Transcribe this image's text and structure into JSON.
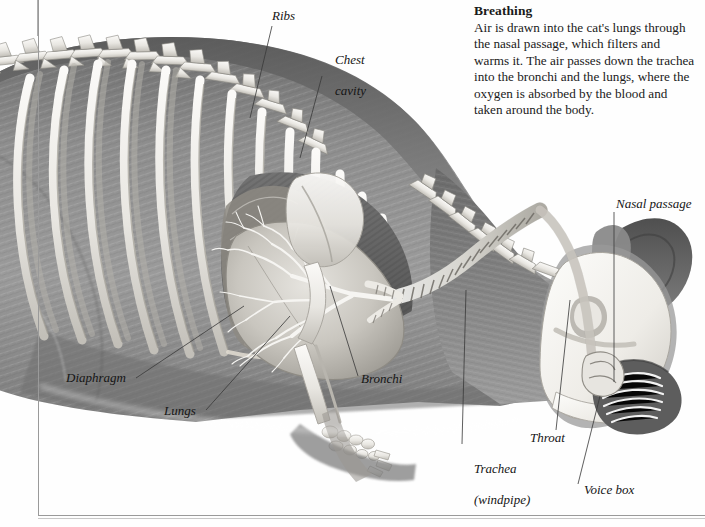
{
  "figure": {
    "style": "grayscale-pencil-illustration"
  },
  "caption": {
    "title": "Breathing",
    "body": "Air is drawn into the cat's lungs through the nasal passage, which filters and warms it. The air passes down the trachea into the bronchi and the lungs, where the oxygen is absorbed by the blood and taken around the body."
  },
  "labels": [
    {
      "id": "ribs",
      "text": "Ribs"
    },
    {
      "id": "chest-cavity",
      "line1": "Chest",
      "line2": "cavity"
    },
    {
      "id": "nasal-passage",
      "text": "Nasal passage"
    },
    {
      "id": "diaphragm",
      "text": "Diaphragm"
    },
    {
      "id": "lungs",
      "text": "Lungs"
    },
    {
      "id": "bronchi",
      "text": "Bronchi"
    },
    {
      "id": "trachea",
      "line1": "Trachea",
      "line2": "(windpipe)"
    },
    {
      "id": "throat",
      "text": "Throat"
    },
    {
      "id": "voice-box",
      "text": "Voice box"
    }
  ],
  "colors": {
    "ink": "#1a1a1a",
    "frame": "#9a9a9a",
    "leader": "#3a3a3a",
    "fur_mid": "#8d8d8d",
    "fur_dark": "#5f5f5f",
    "bone_light": "#f2f1ee",
    "bone_shadow": "#b9b7b2",
    "cavity_dark": "#6d6d6d",
    "page": "#ffffff"
  }
}
